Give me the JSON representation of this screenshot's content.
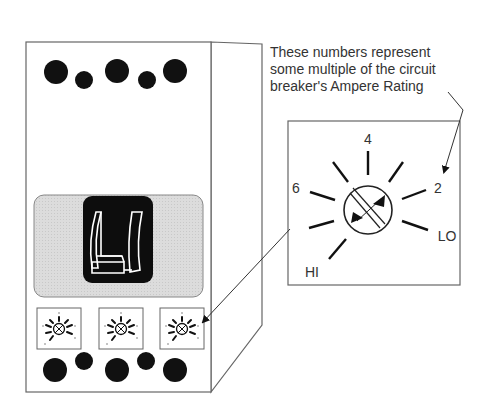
{
  "caption": {
    "lines": [
      "These numbers represent",
      "some multiple of the circuit",
      "breaker's Ampere Rating"
    ]
  },
  "dial": {
    "labels": {
      "top": "4",
      "left": "6",
      "right": "2",
      "low": "LO",
      "high": "HI"
    }
  },
  "breaker": {
    "small_dial_count": 3,
    "top_terminals": 5,
    "bottom_terminals": 5
  },
  "colors": {
    "ink": "#111111",
    "outline": "#555555",
    "panel": "#d9d9d9",
    "text": "#333333"
  }
}
